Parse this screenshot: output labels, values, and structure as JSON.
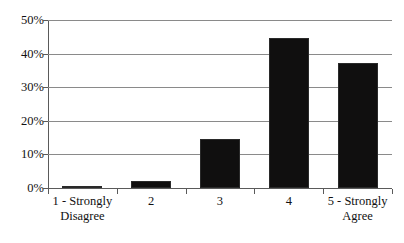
{
  "chart_data": {
    "type": "bar",
    "title": "",
    "subtitle": "",
    "xlabel": "",
    "ylabel": "",
    "categories": [
      "1 - Strongly Disagree",
      "2",
      "3",
      "4",
      "5 - Strongly Agree"
    ],
    "category_lines": [
      [
        "1 - Strongly",
        "Disagree"
      ],
      [
        "2",
        ""
      ],
      [
        "3",
        ""
      ],
      [
        "4",
        ""
      ],
      [
        "5 - Strongly",
        "Agree"
      ]
    ],
    "values": [
      0.3,
      2.1,
      14.6,
      44.5,
      37.2
    ],
    "ylim": [
      0,
      50
    ],
    "ytick_values": [
      0,
      10,
      20,
      30,
      40,
      50
    ],
    "ytick_labels": [
      "0%",
      "10%",
      "20%",
      "30%",
      "40%",
      "50%"
    ],
    "grid": true,
    "grid_axis": "y",
    "legend": false,
    "legend_position": "none",
    "bar_color": "#100f0f",
    "grid_color": "#8a8a8a",
    "axis_color": "#5a5a5a",
    "background_color": "#ffffff"
  }
}
